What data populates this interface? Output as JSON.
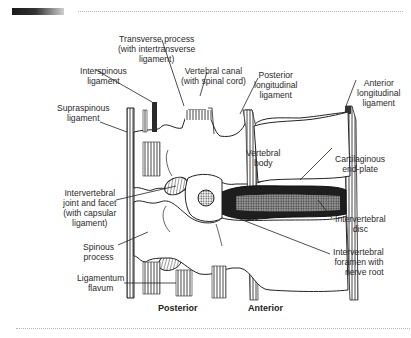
{
  "figure": {
    "orientation": {
      "left": "Posterior",
      "right": "Anterior"
    },
    "labels": {
      "transverse_process": [
        "Transverse process",
        "(with intertransverse",
        "ligament)"
      ],
      "interspinous": [
        "Interspinous",
        "ligament"
      ],
      "vertebral_canal": [
        "Vertebral canal",
        "(with spinal cord)"
      ],
      "posterior_longitudinal": [
        "Posterior",
        "longitudinal",
        "ligament"
      ],
      "anterior_longitudinal": [
        "Anterior",
        "longitudinal",
        "ligament"
      ],
      "supraspinous": [
        "Supraspinous",
        "ligament"
      ],
      "vertebral_body": [
        "Vertebral",
        "body"
      ],
      "cartilaginous_endplate": [
        "Cartilaginous",
        "end-plate"
      ],
      "intervertebral_joint": [
        "Intervertebral",
        "joint and facet",
        "(with capsular",
        "ligament)"
      ],
      "intervertebral_disc": [
        "Intervertebral",
        "disc"
      ],
      "intervertebral_foramen": [
        "Intervertebral",
        "foramen with",
        "nerve root"
      ],
      "spinous_process": [
        "Spinous",
        "process"
      ],
      "ligamentum_flavum": [
        "Ligamentum",
        "flavum"
      ]
    }
  },
  "colors": {
    "background": "#ffffff",
    "ink": "#222222",
    "disc_fill": "#1e1e1e",
    "dotted_rule": "#b5b5b5"
  }
}
